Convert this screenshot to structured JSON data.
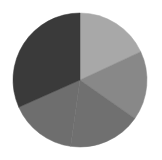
{
  "background_color": "#ffffff",
  "chart_data": {
    "type": "pie",
    "title": "",
    "subtitle": "",
    "xlabel": "",
    "ylabel": "",
    "legend": "none",
    "grid": false,
    "center_x": 80,
    "center_y": 80,
    "radius": 67,
    "start_angle_deg": 0,
    "direction": "clockwise",
    "total": 100,
    "categories": [
      "Slice 1",
      "Slice 2",
      "Slice 3",
      "Slice 4",
      "Slice 5"
    ],
    "values": [
      18.1,
      16.7,
      17.5,
      16.1,
      31.6
    ],
    "colors": [
      "#a8a8a8",
      "#888888",
      "#707070",
      "#6e6e6e",
      "#3a3a3a"
    ],
    "slices": [
      {
        "label": "Slice 1",
        "value": 18.1,
        "percent": "18.1%",
        "color": "#a8a8a8",
        "start_angle_deg": 0,
        "end_angle_deg": 65
      },
      {
        "label": "Slice 2",
        "value": 16.7,
        "percent": "16.7%",
        "color": "#888888",
        "start_angle_deg": 65,
        "end_angle_deg": 125
      },
      {
        "label": "Slice 3",
        "value": 17.5,
        "percent": "17.5%",
        "color": "#707070",
        "start_angle_deg": 125,
        "end_angle_deg": 188
      },
      {
        "label": "Slice 4",
        "value": 16.1,
        "percent": "16.1%",
        "color": "#6e6e6e",
        "start_angle_deg": 188,
        "end_angle_deg": 246
      },
      {
        "label": "Slice 5",
        "value": 31.6,
        "percent": "31.6%",
        "color": "#3a3a3a",
        "start_angle_deg": 246,
        "end_angle_deg": 360
      }
    ]
  }
}
